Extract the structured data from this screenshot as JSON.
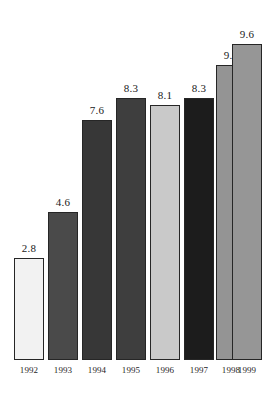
{
  "chart_data": {
    "type": "bar",
    "title": "",
    "subtitle": "",
    "xlabel": "",
    "ylabel": "",
    "grid": false,
    "legend": null,
    "ylim": [
      0,
      9.6
    ],
    "categories": [
      "1992",
      "1993",
      "1994",
      "1995",
      "1996",
      "1997",
      "1998",
      "1999"
    ],
    "values": [
      2.8,
      4.6,
      7.6,
      8.3,
      8.1,
      8.3,
      9.3,
      9.6
    ],
    "value_labels": [
      "2.8",
      "4.6",
      "7.6",
      "8.3",
      "8.1",
      "8.3",
      "9.3",
      "9.6"
    ],
    "bar_colors": [
      "#f2f2f2",
      "#4a4a4a",
      "#373737",
      "#3e3e3e",
      "#c9c9c9",
      "#1c1c1c",
      "#949494",
      "#969696"
    ],
    "bar_border_color": "#262626",
    "background_color": "#ffffff",
    "bars": [
      {
        "category": "1992",
        "value": 2.8,
        "label": "2.8",
        "color": "#f2f2f2",
        "left": 14,
        "width": 30,
        "height": 102
      },
      {
        "category": "1993",
        "value": 4.6,
        "label": "4.6",
        "color": "#4a4a4a",
        "left": 48,
        "width": 30,
        "height": 148
      },
      {
        "category": "1994",
        "value": 7.6,
        "label": "7.6",
        "color": "#373737",
        "left": 82,
        "width": 30,
        "height": 240
      },
      {
        "category": "1995",
        "value": 8.3,
        "label": "8.3",
        "color": "#3e3e3e",
        "left": 116,
        "width": 30,
        "height": 262
      },
      {
        "category": "1996",
        "value": 8.1,
        "label": "8.1",
        "color": "#c9c9c9",
        "left": 150,
        "width": 30,
        "height": 255
      },
      {
        "category": "1997",
        "value": 8.3,
        "label": "8.3",
        "color": "#1c1c1c",
        "left": 184,
        "width": 30,
        "height": 262
      },
      {
        "category": "1998",
        "value": 9.3,
        "label": "9.3",
        "color": "#949494",
        "left": 216,
        "width": 30,
        "height": 295
      },
      {
        "category": "1999",
        "value": 9.6,
        "label": "9.6",
        "color": "#969696",
        "left": 248,
        "width": 30,
        "height": 316
      }
    ]
  }
}
